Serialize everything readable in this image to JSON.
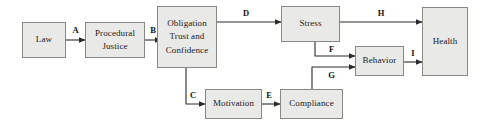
{
  "diagram": {
    "colors": {
      "box_fill": "#e9e9e7",
      "box_border": "#888884",
      "arrow": "#2b2b2b",
      "background": "#ffffff",
      "text": "#1a1a1a"
    },
    "nodes": [
      {
        "id": "law",
        "lines": [
          "Law"
        ]
      },
      {
        "id": "procedural",
        "lines": [
          "Procedural",
          "Justice"
        ]
      },
      {
        "id": "obligation",
        "lines": [
          "Obligation",
          "Trust and",
          "Confidence"
        ]
      },
      {
        "id": "stress",
        "lines": [
          "Stress"
        ]
      },
      {
        "id": "health",
        "lines": [
          "Health"
        ]
      },
      {
        "id": "behavior",
        "lines": [
          "Behavior"
        ]
      },
      {
        "id": "motivation",
        "lines": [
          "Motivation"
        ]
      },
      {
        "id": "compliance",
        "lines": [
          "Compliance"
        ]
      }
    ],
    "edges": [
      {
        "id": "A",
        "label": "A",
        "from": "law",
        "to": "procedural"
      },
      {
        "id": "B",
        "label": "B",
        "from": "procedural",
        "to": "obligation"
      },
      {
        "id": "C",
        "label": "C",
        "from": "obligation",
        "to": "motivation"
      },
      {
        "id": "D",
        "label": "D",
        "from": "obligation",
        "to": "stress"
      },
      {
        "id": "E",
        "label": "E",
        "from": "motivation",
        "to": "compliance"
      },
      {
        "id": "F",
        "label": "F",
        "from": "stress",
        "to": "behavior"
      },
      {
        "id": "G",
        "label": "G",
        "from": "compliance",
        "to": "behavior"
      },
      {
        "id": "H",
        "label": "H",
        "from": "stress",
        "to": "health"
      },
      {
        "id": "I",
        "label": "I",
        "from": "behavior",
        "to": "health"
      }
    ]
  }
}
